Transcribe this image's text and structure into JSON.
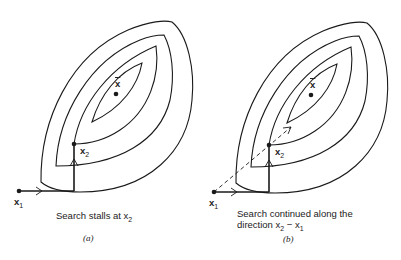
{
  "figure": {
    "panels": [
      {
        "id": "a",
        "label": "(a)",
        "caption_line1": "Search stalls at x",
        "caption_line1_sub": "2",
        "caption_line2": "",
        "points": {
          "x1": {
            "label": "x",
            "sub": "1"
          },
          "x2": {
            "label": "x",
            "sub": "2"
          },
          "optimum": {
            "label": "x"
          }
        },
        "has_pattern_move": false
      },
      {
        "id": "b",
        "label": "(b)",
        "caption_line1": "Search continued along the",
        "caption_line2_prefix": "direction x",
        "caption_line2_sub_a": "2",
        "caption_line2_mid": " − x",
        "caption_line2_sub_b": "1",
        "points": {
          "x1": {
            "label": "x",
            "sub": "1"
          },
          "x2": {
            "label": "x",
            "sub": "2"
          },
          "optimum": {
            "label": "x"
          }
        },
        "has_pattern_move": true
      }
    ],
    "colors": {
      "stroke": "#1a1a1a",
      "text": "#222222",
      "background": "#ffffff"
    }
  }
}
